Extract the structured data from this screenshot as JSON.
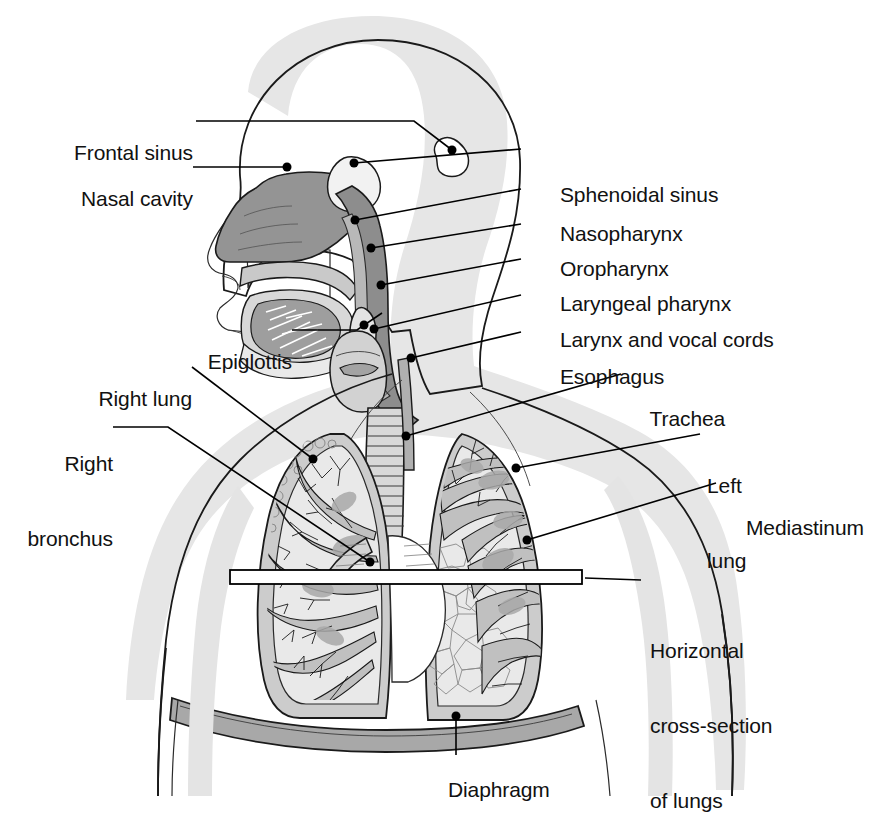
{
  "figure": {
    "background_color": "#ffffff",
    "line_color": "#111111",
    "palette": {
      "body_shadow": "#e2e2e2",
      "body_fill": "#ffffff",
      "mucosa_dark": "#8f8f8f",
      "mucosa_mid": "#a8a8a8",
      "tissue_light": "#d5d5d5",
      "tissue_mid": "#bdbdbd",
      "tissue_dark": "#9a9a9a",
      "lung_pale": "#e8e8e8",
      "pleura": "#cfcfcf",
      "diaphragm": "#a5a5a5"
    }
  },
  "labels_left": [
    {
      "id": "frontal-sinus",
      "text": "Frontal sinus",
      "x": 55,
      "y": 127,
      "lines": [
        "Frontal sinus"
      ]
    },
    {
      "id": "nasal-cavity",
      "text": "Nasal cavity",
      "x": 55,
      "y": 173,
      "lines": [
        "Nasal cavity"
      ]
    },
    {
      "id": "epiglottis",
      "text": "Epiglottis",
      "x": 175,
      "y": 336,
      "lines": [
        "Epiglottis"
      ]
    },
    {
      "id": "right-lung",
      "text": "Right lung",
      "x": 82,
      "y": 373,
      "lines": [
        "Right lung"
      ]
    },
    {
      "id": "right-bronchus",
      "text": "Right bronchus",
      "x": 8,
      "y": 412,
      "lines": [
        "Right",
        "bronchus"
      ]
    }
  ],
  "labels_right": [
    {
      "id": "sphenoidal-sinus",
      "text": "Sphenoidal sinus",
      "x": 537,
      "y": 155,
      "lines": [
        "Sphenoidal sinus"
      ]
    },
    {
      "id": "nasopharynx",
      "text": "Nasopharynx",
      "x": 537,
      "y": 195,
      "lines": [
        "Nasopharynx"
      ]
    },
    {
      "id": "oropharynx",
      "text": "Oropharynx",
      "x": 537,
      "y": 230,
      "lines": [
        "Oropharynx"
      ]
    },
    {
      "id": "laryngeal-pharynx",
      "text": "Laryngeal pharynx",
      "x": 537,
      "y": 265,
      "lines": [
        "Laryngeal pharynx"
      ]
    },
    {
      "id": "larynx-and-vocal-cords",
      "text": "Larynx and vocal cords",
      "x": 537,
      "y": 301,
      "lines": [
        "Larynx and vocal cords"
      ]
    },
    {
      "id": "esophagus",
      "text": "Esophagus",
      "x": 537,
      "y": 338,
      "lines": [
        "Esophagus"
      ]
    },
    {
      "id": "trachea",
      "text": "Trachea",
      "x": 627,
      "y": 380,
      "lines": [
        "Trachea"
      ]
    },
    {
      "id": "left-lung",
      "text": "Left lung",
      "x": 707,
      "y": 428,
      "lines": [
        "Left",
        "lung"
      ]
    },
    {
      "id": "mediastinum",
      "text": "Mediastinum",
      "x": 723,
      "y": 489,
      "lines": [
        "Mediastinum"
      ]
    },
    {
      "id": "horizontal-cross-section",
      "text": "Horizontal cross-section of lungs",
      "x": 650,
      "y": 586,
      "lines": [
        "Horizontal",
        "cross-section",
        "of lungs"
      ]
    }
  ],
  "labels_bottom": [
    {
      "id": "diaphragm",
      "text": "Diaphragm",
      "x": 425,
      "y": 762,
      "lines": [
        "Diaphragm"
      ]
    }
  ],
  "leaders": [
    {
      "id": "leader-frontal-sinus",
      "d": "M 196,121 L 414,121 L 452,150",
      "dot": [
        452,
        150
      ]
    },
    {
      "id": "leader-nasal-cavity",
      "d": "M 193,167 L 287,167",
      "dot": [
        287,
        167
      ]
    },
    {
      "id": "leader-sphenoidal",
      "d": "M 521,149 L 354,163",
      "dot": [
        354,
        163
      ]
    },
    {
      "id": "leader-nasopharynx",
      "d": "M 521,189 L 355,220",
      "dot": [
        355,
        220
      ]
    },
    {
      "id": "leader-oropharynx",
      "d": "M 521,224 L 371,248",
      "dot": [
        371,
        248
      ]
    },
    {
      "id": "leader-laryngeal",
      "d": "M 521,259 L 381,285",
      "dot": [
        381,
        285
      ]
    },
    {
      "id": "leader-larynx",
      "d": "M 521,295 L 374,329",
      "dot": [
        374,
        329
      ]
    },
    {
      "id": "leader-esophagus",
      "d": "M 521,332 L 411,358",
      "dot": [
        411,
        358
      ]
    },
    {
      "id": "leader-epiglottis",
      "d": "M 292,330 L 357,330 L 382,313",
      "dot": [
        364,
        325
      ]
    },
    {
      "id": "leader-trachea",
      "d": "M 621,374 L 406,436",
      "dot": [
        406,
        436
      ]
    },
    {
      "id": "leader-left-lung",
      "d": "M 700,434 L 516,468",
      "dot": [
        516,
        468
      ]
    },
    {
      "id": "leader-mediastinum",
      "d": "M 716,483 L 527,540",
      "dot": [
        527,
        540
      ]
    },
    {
      "id": "leader-right-lung",
      "d": "M 192,367 L 313,459",
      "dot": [
        313,
        459
      ]
    },
    {
      "id": "leader-right-bronchus",
      "d": "M 113,427 L 168,427 L 370,562",
      "dot": [
        370,
        562
      ]
    },
    {
      "id": "leader-diaphragm",
      "d": "M 456,755 L 456,716",
      "dot": [
        456,
        716
      ]
    },
    {
      "id": "leader-cross-section",
      "d": "M 641,580 L 585,578",
      "dot": null
    }
  ],
  "cross_section_bar": {
    "x": 230,
    "y": 570,
    "width": 352,
    "height": 14
  }
}
